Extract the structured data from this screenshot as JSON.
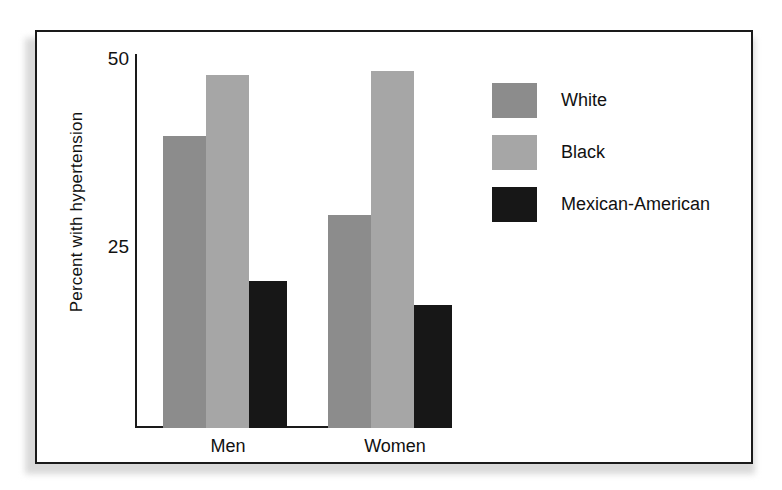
{
  "figure": {
    "background": "#ffffff",
    "frame_color": "#1a1a1a"
  },
  "axes": {
    "ylabel": "Percent with hypertension",
    "yticks": [
      "50",
      "25"
    ],
    "xtick_labels": [
      "Men",
      "Women"
    ]
  },
  "legend": {
    "items": [
      {
        "label": "White",
        "color": "#8c8c8c"
      },
      {
        "label": "Black",
        "color": "#a6a6a6"
      },
      {
        "label": "Mexican-American",
        "color": "#171717"
      }
    ]
  },
  "chart_data": {
    "type": "bar",
    "title": "",
    "xlabel": "",
    "ylabel": "Percent with hypertension",
    "categories": [
      "Men",
      "Women"
    ],
    "ylim": [
      0,
      50
    ],
    "yticks": [
      25,
      50
    ],
    "grid": false,
    "legend_position": "right",
    "series": [
      {
        "name": "White",
        "color": "#8c8c8c",
        "values": [
          38.8,
          28.3
        ]
      },
      {
        "name": "Black",
        "color": "#a6a6a6",
        "values": [
          46.9,
          47.5
        ]
      },
      {
        "name": "Mexican-American",
        "color": "#171717",
        "values": [
          19.5,
          16.3
        ]
      }
    ]
  },
  "geometry": {
    "baseline_y": 396,
    "px_per_unit": 7.52,
    "groups": [
      {
        "name": "Men",
        "label_left": 126,
        "label_width": 130,
        "bars": [
          {
            "series": "White",
            "left": 126,
            "width": 43,
            "color": "#8c8c8c",
            "value": 38.8
          },
          {
            "series": "Black",
            "left": 169,
            "width": 43,
            "color": "#a6a6a6",
            "value": 46.9
          },
          {
            "series": "Mexican-American",
            "left": 212,
            "width": 38,
            "color": "#171717",
            "value": 19.5
          }
        ]
      },
      {
        "name": "Women",
        "label_left": 291,
        "label_width": 134,
        "bars": [
          {
            "series": "White",
            "left": 291,
            "width": 43,
            "color": "#8c8c8c",
            "value": 28.3
          },
          {
            "series": "Black",
            "left": 334,
            "width": 43,
            "color": "#a6a6a6",
            "value": 47.5
          },
          {
            "series": "Mexican-American",
            "left": 377,
            "width": 38,
            "color": "#171717",
            "value": 16.3
          }
        ]
      }
    ]
  }
}
